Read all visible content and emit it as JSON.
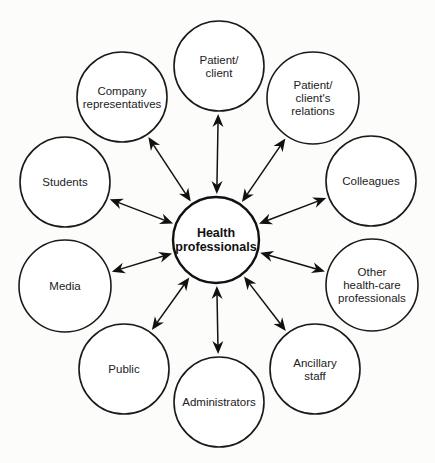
{
  "diagram": {
    "type": "hub-and-spoke",
    "hub": {
      "id": "health-professionals",
      "lines": [
        "Health",
        "professionals"
      ],
      "cx": 216,
      "cy": 240,
      "r": 43
    },
    "nodes": [
      {
        "id": "patient-client",
        "lines": [
          "Patient/",
          "client"
        ],
        "cx": 219,
        "cy": 66,
        "r": 45
      },
      {
        "id": "patient-clients-relations",
        "lines": [
          "Patient/",
          "client's",
          "relations"
        ],
        "cx": 313,
        "cy": 98,
        "r": 46
      },
      {
        "id": "colleagues",
        "lines": [
          "Colleagues"
        ],
        "cx": 371,
        "cy": 181,
        "r": 45
      },
      {
        "id": "other-health-care-professionals",
        "lines": [
          "Other",
          "health-care",
          "professionals"
        ],
        "cx": 372,
        "cy": 285,
        "r": 46
      },
      {
        "id": "ancillary-staff",
        "lines": [
          "Ancillary",
          "staff"
        ],
        "cx": 315,
        "cy": 369,
        "r": 45
      },
      {
        "id": "administrators",
        "lines": [
          "Administrators"
        ],
        "cx": 219,
        "cy": 402,
        "r": 45
      },
      {
        "id": "public",
        "lines": [
          "Public"
        ],
        "cx": 124,
        "cy": 369,
        "r": 45
      },
      {
        "id": "media",
        "lines": [
          "Media"
        ],
        "cx": 65,
        "cy": 286,
        "r": 46
      },
      {
        "id": "students",
        "lines": [
          "Students"
        ],
        "cx": 65,
        "cy": 182,
        "r": 45
      },
      {
        "id": "company-representatives",
        "lines": [
          "Company",
          "representatives"
        ],
        "cx": 122,
        "cy": 97,
        "r": 45
      }
    ],
    "edges": [
      {
        "from": "health-professionals",
        "to": "patient-client",
        "direction": "bidirectional"
      },
      {
        "from": "health-professionals",
        "to": "patient-clients-relations",
        "direction": "bidirectional"
      },
      {
        "from": "health-professionals",
        "to": "colleagues",
        "direction": "bidirectional"
      },
      {
        "from": "health-professionals",
        "to": "other-health-care-professionals",
        "direction": "bidirectional"
      },
      {
        "from": "health-professionals",
        "to": "ancillary-staff",
        "direction": "bidirectional"
      },
      {
        "from": "health-professionals",
        "to": "administrators",
        "direction": "bidirectional"
      },
      {
        "from": "health-professionals",
        "to": "public",
        "direction": "bidirectional"
      },
      {
        "from": "health-professionals",
        "to": "media",
        "direction": "bidirectional"
      },
      {
        "from": "health-professionals",
        "to": "students",
        "direction": "bidirectional"
      },
      {
        "from": "health-professionals",
        "to": "company-representatives",
        "direction": "bidirectional"
      }
    ],
    "colors": {
      "background": "#fcfcfb",
      "stroke": "#111111",
      "text": "#222222"
    }
  }
}
